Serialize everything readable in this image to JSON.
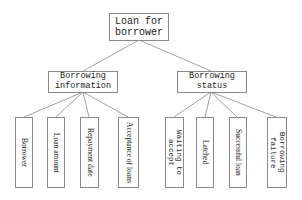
{
  "diagram": {
    "type": "tree",
    "root": {
      "label": "Loan for borrower"
    },
    "branches": [
      {
        "label": "Borrowing information",
        "children": [
          {
            "label": "Borrower"
          },
          {
            "label": "Loan amount"
          },
          {
            "label": "Repayment date"
          },
          {
            "label": "Acceptance of loans"
          }
        ]
      },
      {
        "label": "Borrowing status",
        "children": [
          {
            "label": "Waiting to accept"
          },
          {
            "label": "Latched"
          },
          {
            "label": "Successful loan"
          },
          {
            "label": "Borrowing failure"
          }
        ]
      }
    ],
    "colors": {
      "line": "#8a8a8a",
      "border": "#8a8a8a",
      "text": "#222222",
      "background": "#ffffff"
    }
  }
}
